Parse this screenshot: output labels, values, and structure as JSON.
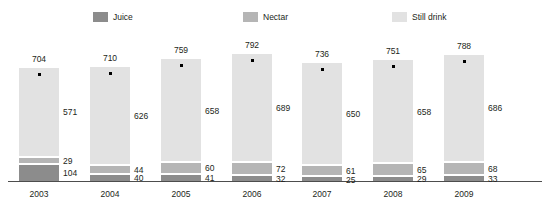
{
  "legend": {
    "items": [
      {
        "label": "Juice",
        "color": "#8c8c8c",
        "x": 93
      },
      {
        "label": "Nectar",
        "color": "#b5b5b5",
        "x": 243
      },
      {
        "label": "Still drink",
        "color": "#e2e2e2",
        "x": 392
      }
    ]
  },
  "chart_data": {
    "type": "bar",
    "subtype": "stacked-bar",
    "title": "",
    "subtitle": "",
    "xlabel": "",
    "ylabel": "",
    "grid": false,
    "legend_position": "top",
    "axis_visible": "x-only",
    "categories": [
      "2003",
      "2004",
      "2005",
      "2006",
      "2007",
      "2008",
      "2009"
    ],
    "series": [
      {
        "name": "Juice",
        "color": "#8c8c8c",
        "values": [
          104,
          40,
          41,
          32,
          25,
          29,
          33
        ]
      },
      {
        "name": "Nectar",
        "color": "#b5b5b5",
        "values": [
          29,
          44,
          60,
          72,
          61,
          65,
          68
        ]
      },
      {
        "name": "Still drink",
        "color": "#e2e2e2",
        "values": [
          571,
          626,
          658,
          689,
          650,
          658,
          686
        ]
      }
    ],
    "totals": [
      704,
      710,
      759,
      792,
      736,
      751,
      788
    ],
    "total_marker": "dot",
    "ylim": [
      0,
      800
    ]
  },
  "plot": {
    "bar_width": 40,
    "bar_left_positions": [
      19,
      90,
      161,
      232,
      302,
      373,
      444
    ],
    "px_per_unit": 0.1555,
    "baseline_y": 181
  }
}
